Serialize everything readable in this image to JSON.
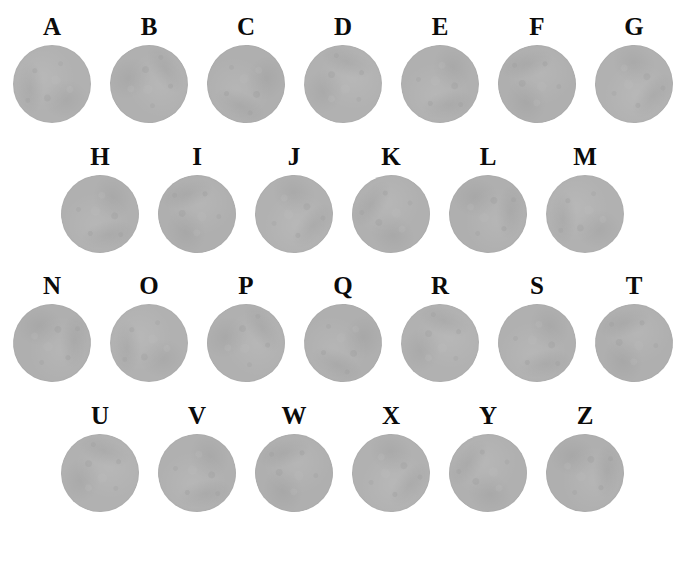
{
  "figure": {
    "background_color": "#ffffff",
    "disc_color": "#b1b1b1",
    "label_color": "#0b0b0b",
    "disc_diameter_px": 78,
    "column_pitch_px": 97
  },
  "rows": [
    {
      "row_id": "row-1",
      "top_px": 12,
      "left_offset_px": 4,
      "cells": [
        {
          "label": "A",
          "shape": "circle"
        },
        {
          "label": "B",
          "shape": "circle"
        },
        {
          "label": "C",
          "shape": "circle"
        },
        {
          "label": "D",
          "shape": "circle"
        },
        {
          "label": "E",
          "shape": "circle"
        },
        {
          "label": "F",
          "shape": "circle"
        },
        {
          "label": "G",
          "shape": "circle"
        }
      ]
    },
    {
      "row_id": "row-2",
      "top_px": 142,
      "left_offset_px": 52,
      "cells": [
        {
          "label": "H",
          "shape": "circle"
        },
        {
          "label": "I",
          "shape": "circle"
        },
        {
          "label": "J",
          "shape": "circle"
        },
        {
          "label": "K",
          "shape": "circle"
        },
        {
          "label": "L",
          "shape": "circle"
        },
        {
          "label": "M",
          "shape": "circle"
        }
      ]
    },
    {
      "row_id": "row-3",
      "top_px": 271,
      "left_offset_px": 4,
      "cells": [
        {
          "label": "N",
          "shape": "circle"
        },
        {
          "label": "O",
          "shape": "circle"
        },
        {
          "label": "P",
          "shape": "circle"
        },
        {
          "label": "Q",
          "shape": "circle"
        },
        {
          "label": "R",
          "shape": "circle"
        },
        {
          "label": "S",
          "shape": "circle"
        },
        {
          "label": "T",
          "shape": "circle"
        }
      ]
    },
    {
      "row_id": "row-4",
      "top_px": 401,
      "left_offset_px": 52,
      "cells": [
        {
          "label": "U",
          "shape": "circle"
        },
        {
          "label": "V",
          "shape": "circle"
        },
        {
          "label": "W",
          "shape": "circle"
        },
        {
          "label": "X",
          "shape": "circle"
        },
        {
          "label": "Y",
          "shape": "circle"
        },
        {
          "label": "Z",
          "shape": "circle"
        }
      ]
    }
  ]
}
